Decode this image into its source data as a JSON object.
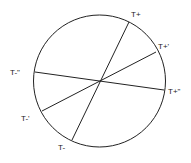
{
  "diagram": {
    "type": "circle-with-diameters",
    "circle": {
      "cx": 99.5,
      "cy": 81,
      "r": 66
    },
    "stroke_color": "#222222",
    "diameters": [
      {
        "id": "primary",
        "start": {
          "label": "T+",
          "x": 129,
          "y": 22,
          "label_x": 131,
          "label_y": 17
        },
        "end": {
          "label": "T-",
          "x": 72,
          "y": 140,
          "label_x": 58,
          "label_y": 150
        }
      },
      {
        "id": "prime",
        "start": {
          "label": "T+'",
          "x": 156,
          "y": 52,
          "label_x": 158,
          "label_y": 49
        },
        "end": {
          "label": "T-'",
          "x": 42,
          "y": 111,
          "label_x": 21,
          "label_y": 121
        }
      },
      {
        "id": "double-prime",
        "start": {
          "label": "T+\"",
          "x": 164,
          "y": 90,
          "label_x": 168,
          "label_y": 94
        },
        "end": {
          "label": "T-\"",
          "x": 35,
          "y": 72,
          "label_x": 10,
          "label_y": 75
        }
      }
    ]
  }
}
